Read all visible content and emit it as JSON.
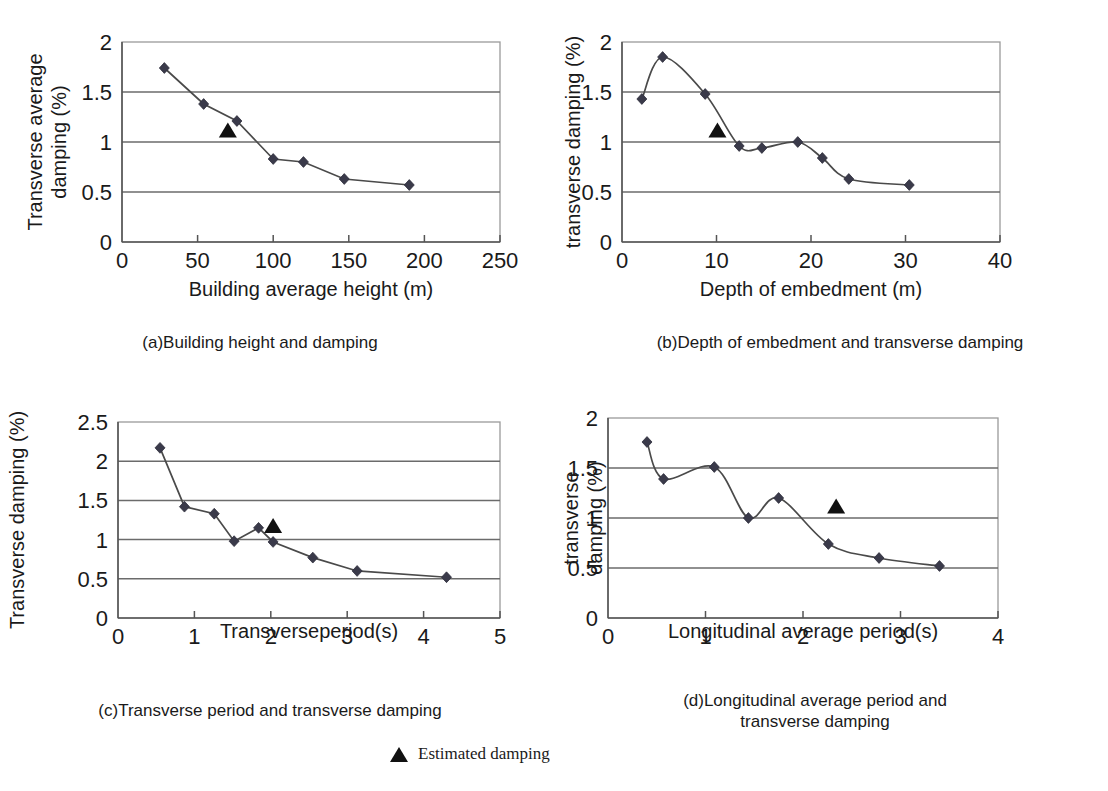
{
  "figure": {
    "legend": {
      "label": "Estimated damping",
      "marker": "triangle-up",
      "marker_color": "#111111"
    },
    "marker_color": "#3a3a4a",
    "line_color": "#4a4a4a",
    "grid_color": "#6b6b6b"
  },
  "panels": {
    "a": {
      "caption": "(a)Building height and damping",
      "ylabel_line1": "Transverse average",
      "ylabel_line2": "damping (%)",
      "xlabel": "Building average height (m)"
    },
    "b": {
      "caption": "(b)Depth of embedment and transverse damping",
      "ylabel_line1": "transverse damping (%)",
      "ylabel_line2": "",
      "xlabel": "Depth of embedment (m)"
    },
    "c": {
      "caption": "(c)Transverse period and transverse damping",
      "ylabel_line1": "Transverse damping (%)",
      "ylabel_line2": "",
      "xlabel": "Transverseperiod(s)"
    },
    "d": {
      "caption_line1": "(d)Longitudinal average period and",
      "caption_line2": "transverse damping",
      "ylabel_line1": "transverse",
      "ylabel_line2": "damping (%)",
      "xlabel": "Longitudinal average period(s)"
    }
  },
  "chart_data": [
    {
      "id": "a",
      "type": "line",
      "title": "(a)Building height and damping",
      "xlabel": "Building average height (m)",
      "ylabel": "Transverse average damping (%)",
      "xlim": [
        0,
        250
      ],
      "ylim": [
        0,
        2
      ],
      "xticks": [
        0,
        50,
        100,
        150,
        200,
        250
      ],
      "yticks": [
        0,
        0.5,
        1,
        1.5,
        2
      ],
      "grid": true,
      "smooth": false,
      "series": [
        {
          "name": "measured damping",
          "marker": "diamond",
          "x": [
            28,
            54,
            76,
            100,
            120,
            147,
            190
          ],
          "y": [
            1.74,
            1.38,
            1.21,
            0.83,
            0.8,
            0.63,
            0.57
          ]
        }
      ],
      "annotations": [
        {
          "name": "estimated-damping",
          "marker": "triangle-up",
          "x": 70,
          "y": 1.12
        }
      ]
    },
    {
      "id": "b",
      "type": "line",
      "title": "(b)Depth of embedment and transverse damping",
      "xlabel": "Depth of embedment (m)",
      "ylabel": "transverse damping (%)",
      "xlim": [
        0,
        40
      ],
      "ylim": [
        0,
        2
      ],
      "xticks": [
        0,
        10,
        20,
        30,
        40
      ],
      "yticks": [
        0,
        0.5,
        1,
        1.5,
        2
      ],
      "grid": true,
      "smooth": true,
      "series": [
        {
          "name": "measured damping",
          "marker": "diamond",
          "x": [
            2.1,
            4.3,
            8.8,
            12.4,
            14.8,
            18.6,
            21.2,
            24.0,
            30.4
          ],
          "y": [
            1.43,
            1.85,
            1.48,
            0.96,
            0.94,
            1.0,
            0.84,
            0.63,
            0.57
          ]
        }
      ],
      "annotations": [
        {
          "name": "estimated-damping",
          "marker": "triangle-up",
          "x": 10.1,
          "y": 1.12
        }
      ]
    },
    {
      "id": "c",
      "type": "line",
      "title": "(c)Transverse period and transverse damping",
      "xlabel": "Transverseperiod(s)",
      "ylabel": "Transverse damping (%)",
      "xlim": [
        0,
        5
      ],
      "ylim": [
        0,
        2.5
      ],
      "xticks": [
        0,
        1,
        2,
        3,
        4,
        5
      ],
      "yticks": [
        0,
        0.5,
        1,
        1.5,
        2,
        2.5
      ],
      "grid": true,
      "smooth": false,
      "series": [
        {
          "name": "measured damping",
          "marker": "diamond",
          "x": [
            0.55,
            0.87,
            1.26,
            1.52,
            1.84,
            2.03,
            2.55,
            3.13,
            4.3
          ],
          "y": [
            2.17,
            1.42,
            1.33,
            0.98,
            1.15,
            0.97,
            0.77,
            0.6,
            0.52
          ]
        }
      ],
      "annotations": [
        {
          "name": "estimated-damping",
          "marker": "triangle-up",
          "x": 2.03,
          "y": 1.18
        }
      ]
    },
    {
      "id": "d",
      "type": "line",
      "title": "(d)Longitudinal average period and transverse damping",
      "xlabel": "Longitudinal average period(s)",
      "ylabel": "transverse damping (%)",
      "xlim": [
        0,
        4
      ],
      "ylim": [
        0,
        2
      ],
      "xticks": [
        0,
        1,
        2,
        3,
        4
      ],
      "yticks": [
        0,
        0.5,
        1,
        1.5,
        2
      ],
      "grid": true,
      "smooth": true,
      "series": [
        {
          "name": "measured damping",
          "marker": "diamond",
          "x": [
            0.4,
            0.57,
            1.09,
            1.44,
            1.75,
            2.26,
            2.78,
            3.4
          ],
          "y": [
            1.76,
            1.39,
            1.51,
            1.0,
            1.2,
            0.74,
            0.6,
            0.52
          ]
        }
      ],
      "annotations": [
        {
          "name": "estimated-damping",
          "marker": "triangle-up",
          "x": 2.34,
          "y": 1.12
        }
      ]
    }
  ]
}
